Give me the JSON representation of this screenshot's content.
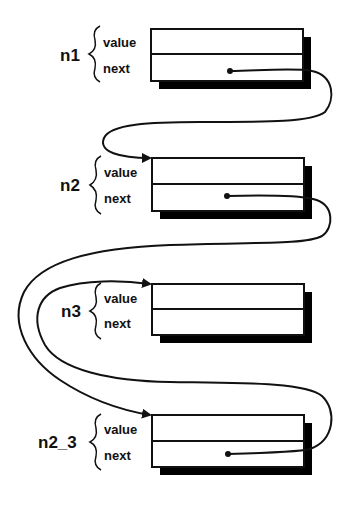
{
  "diagram": {
    "type": "linked-list",
    "nodes": [
      {
        "id": "n1",
        "name": "n1",
        "fields": [
          "value",
          "next"
        ]
      },
      {
        "id": "n2",
        "name": "n2",
        "fields": [
          "value",
          "next"
        ]
      },
      {
        "id": "n3",
        "name": "n3",
        "fields": [
          "value",
          "next"
        ]
      },
      {
        "id": "n2_3",
        "name": "n2_3",
        "fields": [
          "value",
          "next"
        ]
      }
    ],
    "links": [
      {
        "from": "n1.next",
        "to": "n2"
      },
      {
        "from": "n2.next",
        "to": "n2_3"
      },
      {
        "from": "n2_3.next",
        "to": "n3"
      }
    ],
    "colors": {
      "line": "#111111",
      "background": "#ffffff",
      "shadow": "#000000"
    }
  }
}
